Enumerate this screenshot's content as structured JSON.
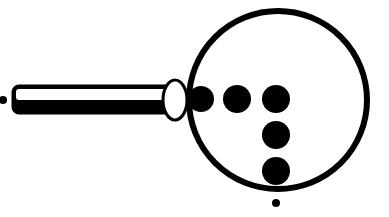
{
  "figure": {
    "colors": {
      "ink": "#000000",
      "paper": "#ffffff"
    },
    "elements": {
      "left_dot": {
        "cx": 3,
        "cy": 100,
        "r": 4
      },
      "rod": {
        "x": 13,
        "y": 86,
        "width": 160,
        "height": 27,
        "rx": 6
      },
      "oval_tip": {
        "cx": 175,
        "cy": 100,
        "rx": 12,
        "ry": 20
      },
      "ring": {
        "cx": 278,
        "cy": 100,
        "r": 89,
        "stroke": 6
      },
      "dots": [
        {
          "cx": 201,
          "cy": 99,
          "r": 13
        },
        {
          "cx": 237,
          "cy": 99,
          "r": 14
        },
        {
          "cx": 276,
          "cy": 99,
          "r": 14
        },
        {
          "cx": 276,
          "cy": 135,
          "r": 14
        },
        {
          "cx": 276,
          "cy": 171,
          "r": 14
        }
      ],
      "bottom_dot": {
        "cx": 276,
        "cy": 203,
        "r": 4
      }
    }
  }
}
